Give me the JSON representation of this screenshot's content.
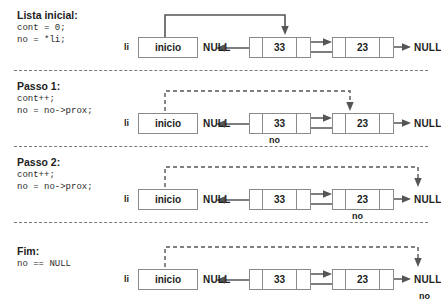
{
  "diagram": {
    "title_colors": {
      "ink": "#1d1d1d",
      "box_border": "#8a8a8a",
      "wire": "#555555"
    },
    "labels": {
      "li": "li",
      "head_box": "inicio",
      "null": "NULL",
      "no": "no"
    },
    "nodes": [
      {
        "value": "33"
      },
      {
        "value": "23"
      }
    ],
    "sections": [
      {
        "id": "lista-inicial",
        "title": "Lista inicial:",
        "code": [
          "cont = 0;",
          "no = *li;"
        ],
        "pointer_style": "solid",
        "pointer_target": "node-33",
        "no_label_target": "none"
      },
      {
        "id": "passo-1",
        "title": "Passo 1:",
        "code": [
          "cont++;",
          "no = no->prox;"
        ],
        "pointer_style": "dashed",
        "pointer_target": "node-23",
        "no_label_target": "node-33"
      },
      {
        "id": "passo-2",
        "title": "Passo 2:",
        "code": [
          "cont++;",
          "no = no->prox;"
        ],
        "pointer_style": "dashed",
        "pointer_target": "null-right",
        "no_label_target": "node-23"
      },
      {
        "id": "fim",
        "title": "Fim:",
        "code": [
          "no == NULL"
        ],
        "pointer_style": "dashed",
        "pointer_target": "null-right",
        "no_label_target": "null-right"
      }
    ]
  }
}
